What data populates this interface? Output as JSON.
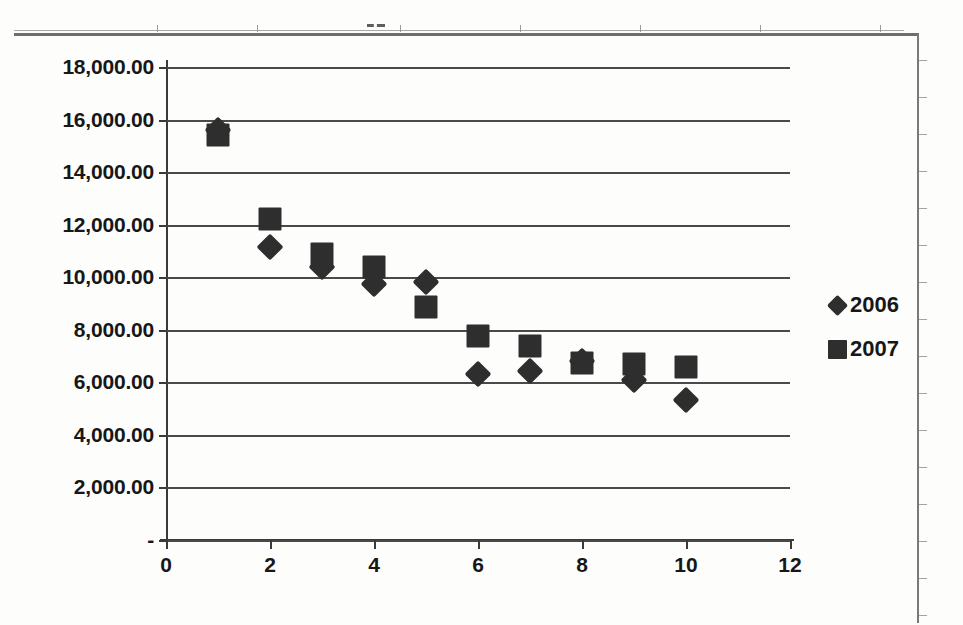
{
  "chart_data": {
    "type": "scatter",
    "title": "",
    "xlabel": "",
    "ylabel": "",
    "xlim": [
      0,
      12
    ],
    "ylim": [
      0,
      18000
    ],
    "grid": true,
    "legend_position": "right",
    "x_ticks": [
      "0",
      "2",
      "4",
      "6",
      "8",
      "10",
      "12"
    ],
    "x_tick_values": [
      0,
      2,
      4,
      6,
      8,
      10,
      12
    ],
    "y_ticks": [
      "-",
      "2,000.00",
      "4,000.00",
      "6,000.00",
      "8,000.00",
      "10,000.00",
      "12,000.00",
      "14,000.00",
      "16,000.00",
      "18,000.00"
    ],
    "y_tick_values": [
      0,
      2000,
      4000,
      6000,
      8000,
      10000,
      12000,
      14000,
      16000,
      18000
    ],
    "x": [
      1,
      2,
      3,
      4,
      5,
      6,
      7,
      8,
      9,
      10
    ],
    "series": [
      {
        "name": "2006",
        "marker": "diamond",
        "color": "#2e2e2e",
        "values": [
          15600,
          11150,
          10400,
          9750,
          9800,
          6320,
          6430,
          6830,
          6100,
          5310
        ]
      },
      {
        "name": "2007",
        "marker": "square",
        "color": "#2e2e2e",
        "values": [
          15400,
          12200,
          10900,
          10400,
          8870,
          7780,
          7400,
          6750,
          6700,
          6570
        ]
      }
    ]
  },
  "legend": {
    "entries": [
      {
        "label": "2006",
        "marker": "diamond"
      },
      {
        "label": "2007",
        "marker": "square"
      }
    ]
  },
  "colors": {
    "marker": "#2e2e2e",
    "gridline": "#4a4a4a",
    "axis": "#3a3a3a",
    "text": "#171717",
    "background": "#fdfdfc"
  }
}
